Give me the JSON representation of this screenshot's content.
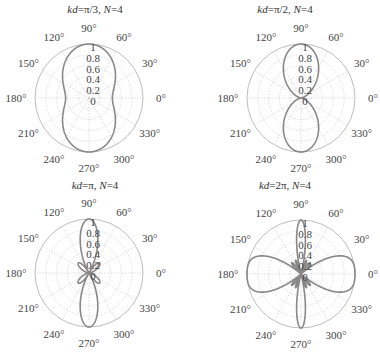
{
  "chart_data": [
    {
      "type": "polar",
      "title": "kd=π/3, N=4",
      "kd": 1.0472,
      "N": 4,
      "center": [
        89,
        98
      ],
      "radius": 54,
      "angle_ticks": [
        "0°",
        "30°",
        "60°",
        "90°",
        "120°",
        "150°",
        "180°",
        "210°",
        "240°",
        "270°",
        "300°",
        "330°"
      ],
      "radial_ticks": [
        "0",
        "0.2",
        "0.4",
        "0.6",
        "0.8",
        "1"
      ],
      "rlim": [
        0,
        1
      ],
      "grid": true,
      "line_color": "#888888"
    },
    {
      "type": "polar",
      "title": "kd=π/2, N=4",
      "kd": 1.5708,
      "N": 4,
      "center": [
        301,
        98
      ],
      "radius": 54,
      "angle_ticks": [
        "0°",
        "30°",
        "60°",
        "90°",
        "120°",
        "150°",
        "180°",
        "210°",
        "240°",
        "270°",
        "300°",
        "330°"
      ],
      "radial_ticks": [
        "0",
        "0.2",
        "0.4",
        "0.6",
        "0.8",
        "1"
      ],
      "rlim": [
        0,
        1
      ],
      "grid": true,
      "line_color": "#888888"
    },
    {
      "type": "polar",
      "title": "kd=π, N=4",
      "kd": 3.1416,
      "N": 4,
      "center": [
        89,
        273
      ],
      "radius": 54,
      "angle_ticks": [
        "0°",
        "30°",
        "60°",
        "90°",
        "120°",
        "150°",
        "180°",
        "210°",
        "240°",
        "270°",
        "300°",
        "330°"
      ],
      "radial_ticks": [
        "0",
        "0.2",
        "0.4",
        "0.6",
        "0.8",
        "1"
      ],
      "rlim": [
        0,
        1
      ],
      "grid": true,
      "line_color": "#888888"
    },
    {
      "type": "polar",
      "title": "kd=2π, N=4",
      "kd": 6.2832,
      "N": 4,
      "center": [
        301,
        274
      ],
      "radius": 54,
      "angle_ticks": [
        "0°",
        "30°",
        "60°",
        "90°",
        "120°",
        "150°",
        "180°",
        "210°",
        "240°",
        "270°",
        "300°",
        "330°"
      ],
      "radial_ticks": [
        "0",
        "0.2",
        "0.4",
        "0.6",
        "0.8",
        "1"
      ],
      "rlim": [
        0,
        1
      ],
      "grid": true,
      "line_color": "#888888"
    }
  ],
  "panels": [
    {
      "title_prefix": "kd",
      "title_val": "=π/3, ",
      "title_n": "N",
      "title_nval": "=4"
    },
    {
      "title_prefix": "kd",
      "title_val": "=π/2, ",
      "title_n": "N",
      "title_nval": "=4"
    },
    {
      "title_prefix": "kd",
      "title_val": "=π, ",
      "title_n": "N",
      "title_nval": "=4"
    },
    {
      "title_prefix": "kd",
      "title_val": "=2π, ",
      "title_n": "N",
      "title_nval": "=4"
    }
  ]
}
